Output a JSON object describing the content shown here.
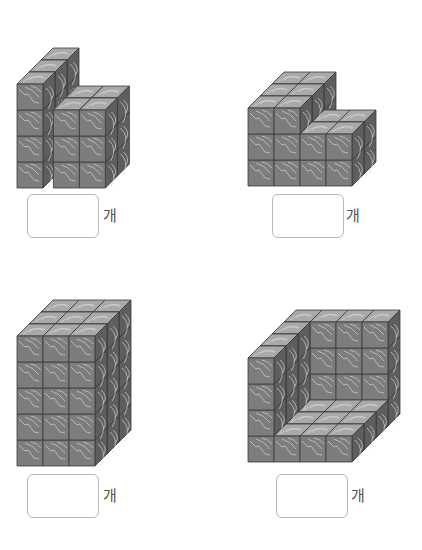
{
  "colors": {
    "front": "#7d7d7d",
    "top": "#a9a9a9",
    "side": "#5e5e5e",
    "edge": "#3a3a3a",
    "grain": "#d6d6d6"
  },
  "cube": {
    "size": 26,
    "dx": 12,
    "dy": 12
  },
  "problems": [
    {
      "id": "problem-1",
      "origin": [
        17,
        188
      ],
      "cubes_note": "left column 1x4 tall x3 deep; right block 2 wide x3 tall x2 deep",
      "answer_box": {
        "x": 27,
        "y": 194,
        "value": ""
      },
      "unit": "개",
      "unit_pos": [
        103,
        213
      ]
    },
    {
      "id": "problem-2",
      "origin": [
        248,
        186
      ],
      "cubes_note": "left block 2 wide x3 tall x3 deep; right block 2 wide x2 tall x2 deep",
      "answer_box": {
        "x": 272,
        "y": 194,
        "value": ""
      },
      "unit": "개",
      "unit_pos": [
        346,
        213
      ]
    },
    {
      "id": "problem-3",
      "origin": [
        17,
        466
      ],
      "cubes_note": "3 wide x5 tall x3 deep with recessed column",
      "answer_box": {
        "x": 27,
        "y": 474,
        "value": ""
      },
      "unit": "개",
      "unit_pos": [
        103,
        492
      ]
    },
    {
      "id": "problem-4",
      "origin": [
        248,
        462
      ],
      "cubes_note": "4x4x4 L-shell: back wall, left wall, floor",
      "answer_box": {
        "x": 276,
        "y": 474,
        "value": ""
      },
      "unit": "개",
      "unit_pos": [
        351,
        492
      ]
    }
  ]
}
